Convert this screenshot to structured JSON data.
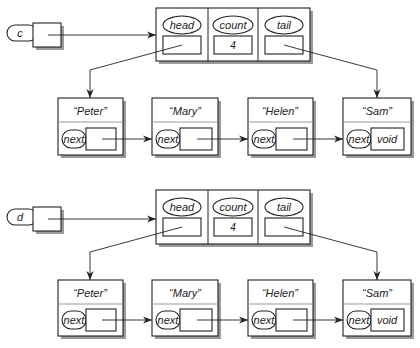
{
  "diagram": {
    "lists": [
      {
        "variable": "c",
        "header": {
          "fields": [
            {
              "label": "head",
              "value": ""
            },
            {
              "label": "count",
              "value": "4"
            },
            {
              "label": "tail",
              "value": ""
            }
          ]
        },
        "nodes": [
          {
            "item": "“Peter”",
            "next_label": "next",
            "next_value": ""
          },
          {
            "item": "“Mary”",
            "next_label": "next",
            "next_value": ""
          },
          {
            "item": "“Helen”",
            "next_label": "next",
            "next_value": ""
          },
          {
            "item": "“Sam”",
            "next_label": "next",
            "next_value": "void"
          }
        ]
      },
      {
        "variable": "d",
        "header": {
          "fields": [
            {
              "label": "head",
              "value": ""
            },
            {
              "label": "count",
              "value": "4"
            },
            {
              "label": "tail",
              "value": ""
            }
          ]
        },
        "nodes": [
          {
            "item": "“Peter”",
            "next_label": "next",
            "next_value": ""
          },
          {
            "item": "“Mary”",
            "next_label": "next",
            "next_value": ""
          },
          {
            "item": "“Helen”",
            "next_label": "next",
            "next_value": ""
          },
          {
            "item": "“Sam”",
            "next_label": "next",
            "next_value": "void"
          }
        ]
      }
    ]
  }
}
